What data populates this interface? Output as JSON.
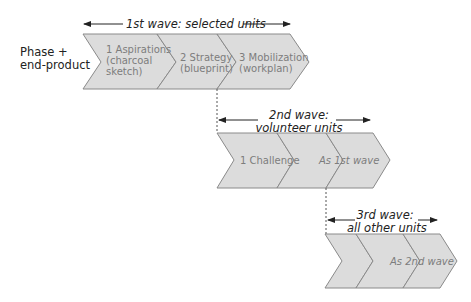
{
  "row_label": [
    "Phase +",
    "end-product"
  ],
  "waves": [
    {
      "title": "1st wave: selected units",
      "phases": [
        {
          "label": [
            "1 Aspirations",
            "(charcoal",
            "sketch)"
          ]
        },
        {
          "label": [
            "2 Strategy",
            "(blueprint)"
          ]
        },
        {
          "label": [
            "3 Mobilization",
            "(workplan)"
          ]
        }
      ]
    },
    {
      "title": [
        "2nd wave:",
        "volunteer units"
      ],
      "phases": [
        {
          "label": [
            "1 Challenge"
          ]
        },
        {
          "label": [
            ""
          ]
        },
        {
          "label": [
            "As 1st wave"
          ]
        }
      ]
    },
    {
      "title": [
        "3rd wave:",
        "all other units"
      ],
      "phases": [
        {
          "label": [
            ""
          ]
        },
        {
          "label": [
            ""
          ]
        },
        {
          "label": [
            "As 2nd wave"
          ]
        }
      ]
    }
  ],
  "colors": {
    "chevron_fill": "#dcdcdc",
    "chevron_stroke": "#8a8a8a",
    "text": "#222222",
    "phase_text": "#7d7d7d"
  }
}
